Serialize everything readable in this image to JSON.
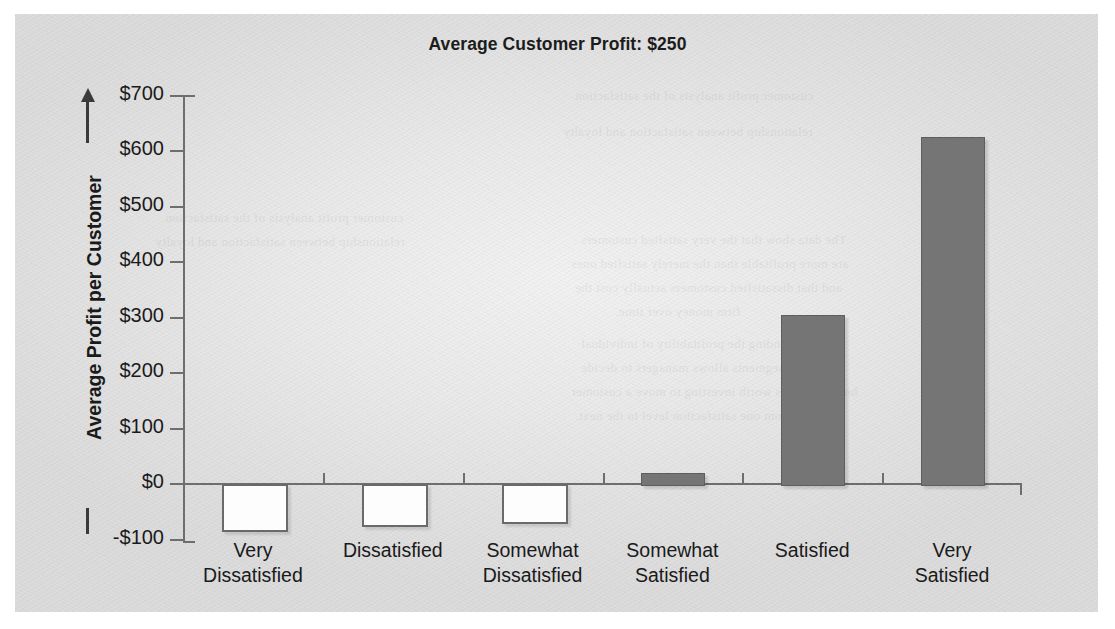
{
  "chart_data": {
    "type": "bar",
    "title": "Average Customer Profit: $250",
    "xlabel": "",
    "ylabel": "Average Profit per Customer",
    "categories": [
      "Very Dissatisfied",
      "Dissatisfied",
      "Somewhat Dissatisfied",
      "Somewhat Satisfied",
      "Satisfied",
      "Very Satisfied"
    ],
    "category_lines": [
      [
        "Very",
        "Dissatisfied"
      ],
      [
        "Dissatisfied",
        ""
      ],
      [
        "Somewhat",
        "Dissatisfied"
      ],
      [
        "Somewhat",
        "Satisfied"
      ],
      [
        "Satisfied",
        ""
      ],
      [
        "Very",
        "Satisfied"
      ]
    ],
    "values": [
      -80,
      -70,
      -65,
      20,
      305,
      625
    ],
    "ylim": [
      -100,
      700
    ],
    "ytick_values": [
      700,
      600,
      500,
      400,
      300,
      200,
      100,
      0,
      -100
    ],
    "ytick_labels": [
      "$700",
      "$600",
      "$500",
      "$400",
      "$300",
      "$200",
      "$100",
      "$0",
      "-$100"
    ],
    "grid": false,
    "legend": false,
    "bar_fill_positive": "#757575",
    "bar_fill_negative": "#fdfdfd",
    "bar_stroke": "#6a6a6a",
    "axis_color": "#6e6e6e",
    "text_color": "#1a1a1a",
    "panel_background": "#e8e8e8"
  },
  "bleed_text": [
    "customer profit analysis of the satisfaction",
    "relationship between satisfaction and loyalty",
    "The data show that the very satisfied customers",
    "are more profitable than the merely satisfied ones",
    "and that dissatisfied customers actually cost the",
    "firm money over time.",
    "Understanding the profitability of individual",
    "customer segments allows managers to decide",
    "how much it is worth investing to move a customer",
    "from one satisfaction level to the next."
  ]
}
